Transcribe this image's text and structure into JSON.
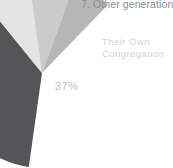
{
  "chart_data": {
    "type": "pie",
    "title": "7. Other generations",
    "xlabel": "",
    "ylabel": "",
    "grid": false,
    "legend": "none",
    "note": "Cropped view: only the lower-left portion of the pie is visible; remaining slices run off the right and top edges.",
    "center": {
      "x": 42,
      "y": 73
    },
    "radius": 95,
    "categories": [
      "Their Own Congregation",
      "Other generations"
    ],
    "values": [
      37,
      63
    ],
    "slices": [
      {
        "label": "Their Own Congregation",
        "value": 37,
        "value_label": "37%",
        "color": "#555558",
        "start_angle_deg": 188,
        "end_angle_deg": 321,
        "visible": true
      },
      {
        "label": "",
        "value": null,
        "value_label": "",
        "color": "#e4e4e4",
        "start_angle_deg": 321,
        "end_angle_deg": 352,
        "visible": true
      },
      {
        "label": "",
        "value": null,
        "value_label": "",
        "color": "#cbcbcb",
        "start_angle_deg": 352,
        "end_angle_deg": 20,
        "visible": true
      },
      {
        "label": "",
        "value": null,
        "value_label": "",
        "color": "#b6b6b6",
        "start_angle_deg": 20,
        "end_angle_deg": 44,
        "visible": true
      }
    ]
  },
  "chart": {
    "title": "7. Other generations",
    "background_color": "#ffffff",
    "labels": {
      "congregation": {
        "line1": "Their Own",
        "line2": "Congregation",
        "color": "#d2d2d2"
      },
      "own_share": {
        "text": "37%",
        "color": "#c2c2c2"
      }
    },
    "colors": {
      "slice_dark": "#555558",
      "slice_light": "#e4e4e4",
      "slice_mid_light": "#cbcbcb",
      "slice_mid": "#b6b6b6",
      "title_text": "#8e8e8e"
    }
  }
}
